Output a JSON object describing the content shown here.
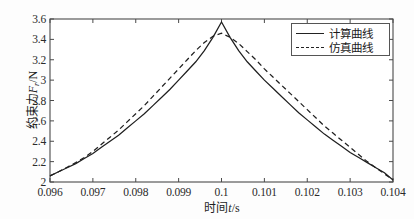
{
  "chart_data": {
    "type": "line",
    "title": "",
    "xlabel": "时间t/s",
    "ylabel": "约束力F/N",
    "ylabel_main": "约束力",
    "ylabel_var": "F",
    "ylabel_sub": "r",
    "ylabel_unit": "/N",
    "xlabel_main": "时间",
    "xlabel_var": "t",
    "xlabel_unit": "/s",
    "xlim": [
      0.096,
      0.104
    ],
    "ylim": [
      2.0,
      3.6
    ],
    "grid": false,
    "legend_position": "top-right",
    "xticks": [
      "0.096",
      "0.097",
      "0.098",
      "0.099",
      "0.1",
      "0.101",
      "0.102",
      "0.103",
      "0.104"
    ],
    "xtick_values": [
      0.096,
      0.097,
      0.098,
      0.099,
      0.1,
      0.101,
      0.102,
      0.103,
      0.104
    ],
    "yticks": [
      "2",
      "2.2",
      "2.4",
      "2.6",
      "2.8",
      "3",
      "3.2",
      "3.4",
      "3.6"
    ],
    "ytick_values": [
      2,
      2.2,
      2.4,
      2.6,
      2.8,
      3,
      3.2,
      3.4,
      3.6
    ],
    "series": [
      {
        "name": "计算曲线",
        "style": "solid",
        "color": "#1f1f1f",
        "x": [
          0.096,
          0.0962,
          0.0964,
          0.0966,
          0.0968,
          0.097,
          0.0972,
          0.0974,
          0.0976,
          0.0978,
          0.098,
          0.0982,
          0.0984,
          0.0986,
          0.0988,
          0.099,
          0.0992,
          0.0994,
          0.0996,
          0.0998,
          0.1,
          0.1002,
          0.1004,
          0.1006,
          0.1008,
          0.101,
          0.1012,
          0.1014,
          0.1016,
          0.1018,
          0.102,
          0.1022,
          0.1024,
          0.1026,
          0.1028,
          0.103,
          0.1032,
          0.1034,
          0.1036,
          0.1038,
          0.104
        ],
        "y": [
          2.06,
          2.1,
          2.14,
          2.18,
          2.23,
          2.28,
          2.34,
          2.4,
          2.46,
          2.53,
          2.6,
          2.67,
          2.75,
          2.83,
          2.91,
          3.0,
          3.09,
          3.18,
          3.29,
          3.42,
          3.57,
          3.42,
          3.29,
          3.18,
          3.09,
          3.0,
          2.92,
          2.84,
          2.76,
          2.68,
          2.61,
          2.54,
          2.47,
          2.41,
          2.35,
          2.29,
          2.24,
          2.19,
          2.14,
          2.09,
          2.02
        ]
      },
      {
        "name": "仿真曲线",
        "style": "dashed",
        "color": "#1f1f1f",
        "x": [
          0.096,
          0.0962,
          0.0964,
          0.0966,
          0.0968,
          0.097,
          0.0972,
          0.0974,
          0.0976,
          0.0978,
          0.098,
          0.0982,
          0.0984,
          0.0986,
          0.0988,
          0.099,
          0.0992,
          0.0994,
          0.0996,
          0.0998,
          0.1,
          0.1002,
          0.1004,
          0.1006,
          0.1008,
          0.101,
          0.1012,
          0.1014,
          0.1016,
          0.1018,
          0.102,
          0.1022,
          0.1024,
          0.1026,
          0.1028,
          0.103,
          0.1032,
          0.1034,
          0.1036,
          0.1038,
          0.104
        ],
        "y": [
          2.06,
          2.1,
          2.145,
          2.19,
          2.24,
          2.3,
          2.37,
          2.44,
          2.51,
          2.59,
          2.67,
          2.75,
          2.84,
          2.93,
          3.02,
          3.11,
          3.2,
          3.29,
          3.37,
          3.43,
          3.46,
          3.42,
          3.36,
          3.28,
          3.2,
          3.11,
          3.03,
          2.95,
          2.87,
          2.79,
          2.71,
          2.63,
          2.55,
          2.48,
          2.41,
          2.34,
          2.27,
          2.2,
          2.14,
          2.08,
          2.02
        ]
      }
    ],
    "annotations": {
      "peak_solid": {
        "x": 0.1,
        "y": 3.57
      },
      "peak_dashed": {
        "x": 0.1,
        "y": 3.46
      }
    }
  },
  "legend": {
    "items": [
      {
        "label": "计算曲线",
        "style": "solid"
      },
      {
        "label": "仿真曲线",
        "style": "dashed"
      }
    ]
  },
  "colors": {
    "axis": "#4a4a4a",
    "curve": "#1f1f1f",
    "background": "#fdfdfd",
    "plot_background": "#ffffff"
  }
}
